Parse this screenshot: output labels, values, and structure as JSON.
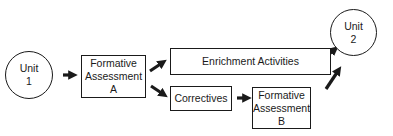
{
  "diagram": {
    "nodes": {
      "unit1": {
        "line1": "Unit",
        "line2": "1"
      },
      "fa_a": {
        "line1": "Formative",
        "line2": "Assessment",
        "line3": "A"
      },
      "enrichment": {
        "label": "Enrichment Activities"
      },
      "correctives": {
        "label": "Correctives"
      },
      "fa_b": {
        "line1": "Formative",
        "line2": "Assessment",
        "line3": "B"
      },
      "unit2": {
        "line1": "Unit",
        "line2": "2"
      }
    },
    "edges": [
      {
        "from": "Unit 1",
        "to": "Formative Assessment A"
      },
      {
        "from": "Formative Assessment A",
        "to": "Enrichment Activities"
      },
      {
        "from": "Formative Assessment A",
        "to": "Correctives"
      },
      {
        "from": "Correctives",
        "to": "Formative Assessment B"
      },
      {
        "from": "Enrichment Activities",
        "to": "Unit 2"
      },
      {
        "from": "Formative Assessment B",
        "to": "Unit 2"
      }
    ],
    "colors": {
      "stroke": "#1a1a1a",
      "background": "#ffffff"
    }
  }
}
